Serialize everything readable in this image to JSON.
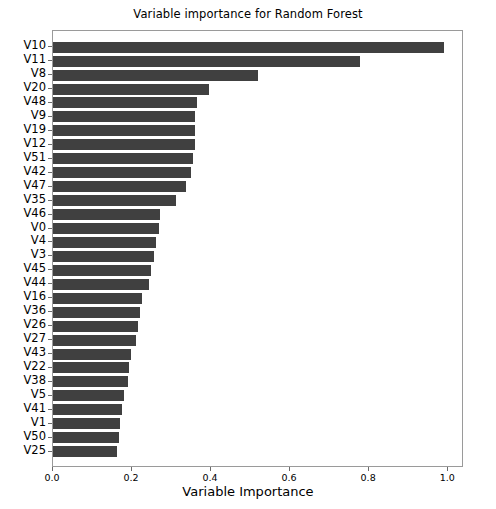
{
  "chart_data": {
    "type": "bar",
    "orientation": "horizontal",
    "title": "Variable importance for Random Forest",
    "xlabel": "Variable Importance",
    "ylabel": "",
    "xlim": [
      0.0,
      1.04
    ],
    "xticks": [
      "0.0",
      "0.2",
      "0.4",
      "0.6",
      "0.8",
      "1.0"
    ],
    "xtick_values": [
      0.0,
      0.2,
      0.4,
      0.6,
      0.8,
      1.0
    ],
    "grid": false,
    "legend": "none",
    "bar_color": "#404040",
    "categories": [
      "V10",
      "V11",
      "V8",
      "V20",
      "V48",
      "V9",
      "V19",
      "V12",
      "V51",
      "V42",
      "V47",
      "V35",
      "V46",
      "V0",
      "V4",
      "V3",
      "V45",
      "V44",
      "V16",
      "V36",
      "V26",
      "V27",
      "V43",
      "V22",
      "V38",
      "V5",
      "V41",
      "V1",
      "V50",
      "V25"
    ],
    "values": [
      0.99,
      0.776,
      0.518,
      0.394,
      0.365,
      0.36,
      0.36,
      0.36,
      0.355,
      0.348,
      0.336,
      0.311,
      0.272,
      0.268,
      0.26,
      0.255,
      0.248,
      0.243,
      0.226,
      0.221,
      0.214,
      0.209,
      0.197,
      0.192,
      0.19,
      0.18,
      0.175,
      0.17,
      0.168,
      0.163
    ]
  }
}
